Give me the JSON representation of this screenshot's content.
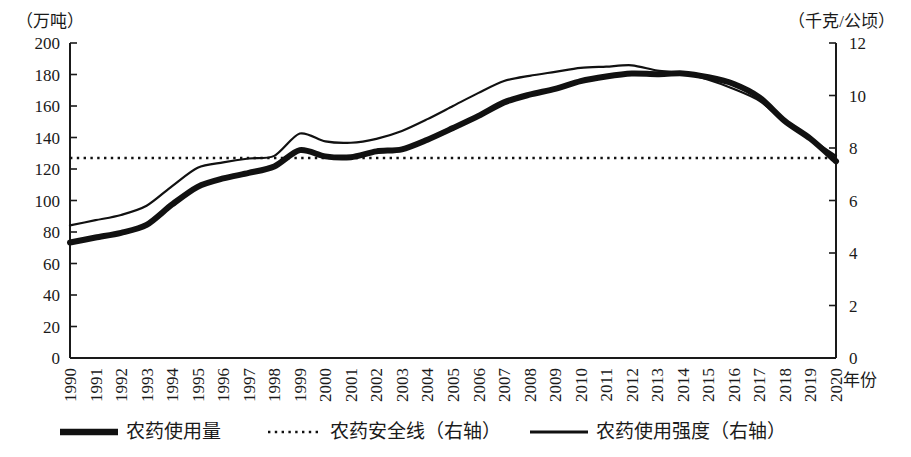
{
  "chart_data": {
    "type": "line",
    "title": "",
    "xlabel": "年份",
    "ylabel_left": "（万吨）",
    "ylabel_right": "（千克/公顷）",
    "grid": false,
    "legend_position": "bottom",
    "x": [
      1990,
      1991,
      1992,
      1993,
      1994,
      1995,
      1996,
      1997,
      1998,
      1999,
      2000,
      2001,
      2002,
      2003,
      2004,
      2005,
      2006,
      2007,
      2008,
      2009,
      2010,
      2011,
      2012,
      2013,
      2014,
      2015,
      2016,
      2017,
      2018,
      2019,
      2020
    ],
    "xtick_labels": [
      "1990",
      "1991",
      "1992",
      "1993",
      "1994",
      "1995",
      "1996",
      "1997",
      "1998",
      "1999",
      "2000",
      "2001",
      "2002",
      "2003",
      "2004",
      "2005",
      "2006",
      "2007",
      "2008",
      "2009",
      "2010",
      "2011",
      "2012",
      "2013",
      "2014",
      "2015",
      "2016",
      "2017",
      "2018",
      "2019",
      "2020"
    ],
    "ylim_left": [
      0,
      200
    ],
    "ytick_left": [
      0,
      20,
      40,
      60,
      80,
      100,
      120,
      140,
      160,
      180,
      200
    ],
    "ylim_right": [
      0,
      12
    ],
    "ytick_right": [
      0,
      2,
      4,
      6,
      8,
      10,
      12
    ],
    "series": [
      {
        "name": "农药使用量",
        "axis": "left",
        "unit": "万吨",
        "style": "thick-solid",
        "values": [
          73.3,
          76.5,
          79.5,
          84.5,
          97.5,
          108.7,
          114.0,
          117.5,
          121.6,
          132.0,
          128.0,
          127.5,
          131.2,
          132.5,
          138.6,
          146.0,
          153.7,
          162.3,
          167.2,
          170.9,
          175.8,
          178.7,
          180.6,
          180.2,
          180.7,
          178.3,
          174.0,
          165.5,
          150.4,
          139.2,
          124.9
        ]
      },
      {
        "name": "农药安全线（右轴）",
        "axis": "right",
        "unit": "千克/公顷",
        "style": "dotted",
        "values": [
          7.62,
          7.62,
          7.62,
          7.62,
          7.62,
          7.62,
          7.62,
          7.62,
          7.62,
          7.62,
          7.62,
          7.62,
          7.62,
          7.62,
          7.62,
          7.62,
          7.62,
          7.62,
          7.62,
          7.62,
          7.62,
          7.62,
          7.62,
          7.62,
          7.62,
          7.62,
          7.62,
          7.62,
          7.62,
          7.62,
          7.62
        ]
      },
      {
        "name": "农药使用强度（右轴）",
        "axis": "right",
        "unit": "千克/公顷",
        "style": "thin-solid",
        "values": [
          5.05,
          5.25,
          5.45,
          5.8,
          6.55,
          7.25,
          7.45,
          7.6,
          7.7,
          8.55,
          8.25,
          8.2,
          8.35,
          8.65,
          9.1,
          9.6,
          10.1,
          10.55,
          10.75,
          10.9,
          11.05,
          11.1,
          11.15,
          10.95,
          10.85,
          10.6,
          10.25,
          9.8,
          9.0,
          8.35,
          7.7
        ]
      }
    ]
  },
  "legend": {
    "items": [
      {
        "label": "农药使用量",
        "style": "thick-solid"
      },
      {
        "label": "农药安全线（右轴）",
        "style": "dotted"
      },
      {
        "label": "农药使用强度（右轴）",
        "style": "thin-solid"
      }
    ]
  },
  "colors": {
    "ink": "#1a1a1a",
    "series": "#111111",
    "background": "#ffffff"
  }
}
